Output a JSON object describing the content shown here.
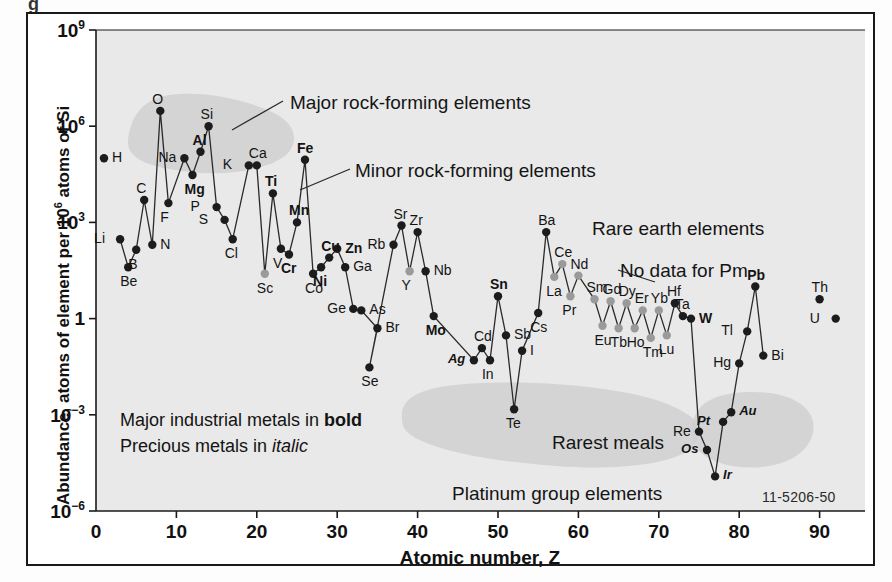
{
  "figure": {
    "id_code": "11-5206-50",
    "top_partial_glyph": "g"
  },
  "axes": {
    "y_label_prefix": "Abundance, atoms of element per 10",
    "y_label_sup": "6",
    "y_label_suffix": " atoms of Si",
    "x_label": "Atomic number, Z",
    "y_ticks": [
      {
        "label": "10",
        "sup": "9",
        "value": 1000000000.0
      },
      {
        "label": "10",
        "sup": "6",
        "value": 1000000.0
      },
      {
        "label": "10",
        "sup": "3",
        "value": 1000.0
      },
      {
        "label": "1",
        "sup": "",
        "value": 1
      },
      {
        "label": "10",
        "sup": "−3",
        "value": 0.001
      },
      {
        "label": "10",
        "sup": "−6",
        "value": 1e-06
      }
    ],
    "x_ticks": [
      "0",
      "10",
      "20",
      "30",
      "40",
      "50",
      "60",
      "70",
      "80",
      "90"
    ]
  },
  "annotations": [
    {
      "name": "major-rock-forming",
      "text": "Major rock-forming elements"
    },
    {
      "name": "minor-rock-forming",
      "text": "Minor rock-forming elements"
    },
    {
      "name": "rare-earth",
      "text": "Rare earth elements"
    },
    {
      "name": "no-data-pm",
      "text": "No data for Pm"
    },
    {
      "name": "rarest-metals",
      "text": "Rarest meals"
    },
    {
      "name": "platinum-group",
      "text": "Platinum group elements"
    }
  ],
  "legend": {
    "line1_pre": "Major industrial metals in ",
    "line1_bold": "bold",
    "line2_pre": "Precious metals in ",
    "line2_ital": "italic"
  },
  "colors": {
    "plot_background": "#e9e9e9",
    "highlight_blob": "#cfcfcf",
    "point_dark": "#1c1c1c",
    "point_light": "#9a9a9a",
    "line": "#2a2a2a",
    "frame": "#1a1a1a",
    "text": "#141414"
  },
  "chart_data": {
    "type": "scatter",
    "title": "",
    "xlabel": "Atomic number, Z",
    "ylabel": "Abundance, atoms of element per 10^6 atoms of Si",
    "xlim": [
      0,
      95
    ],
    "ylim": [
      1e-06,
      1000000000.0
    ],
    "yscale": "log",
    "grid": false,
    "legend": "none",
    "note": "Abundance of the chemical elements in Earth's crust versus atomic number Z. Values are atoms of element per 10^6 atoms of Si.",
    "points": [
      {
        "symbol": "H",
        "z": 1,
        "value": 100000.0,
        "style": "plain",
        "lpos": "right",
        "connected": false,
        "shade": "dark"
      },
      {
        "symbol": "Li",
        "z": 3,
        "value": 300.0,
        "style": "plain",
        "lpos": "left",
        "connected": true,
        "shade": "dark"
      },
      {
        "symbol": "Be",
        "z": 4,
        "value": 40.0,
        "style": "plain",
        "lpos": "below",
        "connected": true,
        "shade": "dark"
      },
      {
        "symbol": "B",
        "z": 5,
        "value": 140.0,
        "style": "plain",
        "lpos": "below",
        "connected": true,
        "shade": "dark"
      },
      {
        "symbol": "C",
        "z": 6,
        "value": 5000.0,
        "style": "plain",
        "lpos": "above",
        "connected": true,
        "shade": "dark"
      },
      {
        "symbol": "N",
        "z": 7,
        "value": 200.0,
        "style": "right",
        "lpos": "right",
        "connected": true,
        "shade": "dark"
      },
      {
        "symbol": "O",
        "z": 8,
        "value": 3000000.0,
        "style": "plain",
        "lpos": "above",
        "connected": true,
        "shade": "dark"
      },
      {
        "symbol": "F",
        "z": 9,
        "value": 4000.0,
        "style": "plain",
        "lpos": "below",
        "connected": true,
        "shade": "dark"
      },
      {
        "symbol": "Na",
        "z": 11,
        "value": 100000.0,
        "style": "plain",
        "lpos": "left",
        "connected": true,
        "shade": "dark"
      },
      {
        "symbol": "Mg",
        "z": 12,
        "value": 30000.0,
        "style": "bold",
        "lpos": "below",
        "connected": true,
        "shade": "dark"
      },
      {
        "symbol": "Al",
        "z": 13,
        "value": 160000.0,
        "style": "bold",
        "lpos": "above",
        "connected": true,
        "shade": "dark"
      },
      {
        "symbol": "Si",
        "z": 14,
        "value": 1000000.0,
        "style": "plain",
        "lpos": "above",
        "connected": true,
        "shade": "dark"
      },
      {
        "symbol": "P",
        "z": 15,
        "value": 3000.0,
        "style": "plain",
        "lpos": "left",
        "connected": true,
        "shade": "dark"
      },
      {
        "symbol": "S",
        "z": 16,
        "value": 1200.0,
        "style": "plain",
        "lpos": "left",
        "connected": true,
        "shade": "dark"
      },
      {
        "symbol": "Cl",
        "z": 17,
        "value": 300.0,
        "style": "plain",
        "lpos": "below",
        "connected": true,
        "shade": "dark"
      },
      {
        "symbol": "K",
        "z": 19,
        "value": 60000.0,
        "style": "plain",
        "lpos": "left",
        "connected": true,
        "shade": "dark"
      },
      {
        "symbol": "Ca",
        "z": 20,
        "value": 60000.0,
        "style": "plain",
        "lpos": "above",
        "connected": true,
        "shade": "dark"
      },
      {
        "symbol": "Sc",
        "z": 21,
        "value": 25.0,
        "style": "plain",
        "lpos": "below",
        "connected": true,
        "shade": "light"
      },
      {
        "symbol": "Ti",
        "z": 22,
        "value": 8000.0,
        "style": "bold",
        "lpos": "above",
        "connected": true,
        "shade": "dark"
      },
      {
        "symbol": "V",
        "z": 23,
        "value": 150.0,
        "style": "plain",
        "lpos": "below",
        "connected": true,
        "shade": "dark"
      },
      {
        "symbol": "Cr",
        "z": 24,
        "value": 100.0,
        "style": "bold",
        "lpos": "below",
        "connected": true,
        "shade": "dark"
      },
      {
        "symbol": "Mn",
        "z": 25,
        "value": 1000.0,
        "style": "bold",
        "lpos": "above",
        "connected": true,
        "shade": "dark"
      },
      {
        "symbol": "Fe",
        "z": 26,
        "value": 90000.0,
        "style": "bold",
        "lpos": "above",
        "connected": true,
        "shade": "dark"
      },
      {
        "symbol": "Co",
        "z": 27,
        "value": 25.0,
        "style": "plain",
        "lpos": "below",
        "connected": true,
        "shade": "dark"
      },
      {
        "symbol": "Ni",
        "z": 28,
        "value": 40.0,
        "style": "bold",
        "lpos": "below",
        "connected": true,
        "shade": "dark"
      },
      {
        "symbol": "Cu",
        "z": 29,
        "value": 80.0,
        "style": "bold",
        "lpos": "above",
        "connected": true,
        "shade": "dark"
      },
      {
        "symbol": "Zn",
        "z": 30,
        "value": 150.0,
        "style": "bold",
        "lpos": "right",
        "connected": true,
        "shade": "dark"
      },
      {
        "symbol": "Ga",
        "z": 31,
        "value": 40.0,
        "style": "right",
        "lpos": "right",
        "connected": true,
        "shade": "dark"
      },
      {
        "symbol": "Ge",
        "z": 32,
        "value": 2.0,
        "style": "plain",
        "lpos": "left",
        "connected": true,
        "shade": "dark"
      },
      {
        "symbol": "As",
        "z": 33,
        "value": 1.8,
        "style": "plain",
        "lpos": "right",
        "connected": true,
        "shade": "dark"
      },
      {
        "symbol": "Br",
        "z": 35,
        "value": 0.5,
        "style": "plain",
        "lpos": "right",
        "connected": true,
        "shade": "dark"
      },
      {
        "symbol": "Se",
        "z": 34,
        "value": 0.03,
        "style": "plain",
        "lpos": "below",
        "connected": true,
        "shade": "dark"
      },
      {
        "symbol": "Rb",
        "z": 37,
        "value": 200.0,
        "style": "plain",
        "lpos": "left",
        "connected": true,
        "shade": "dark"
      },
      {
        "symbol": "Sr",
        "z": 38,
        "value": 800.0,
        "style": "plain",
        "lpos": "above",
        "connected": true,
        "shade": "dark"
      },
      {
        "symbol": "Y",
        "z": 39,
        "value": 30.0,
        "style": "plain",
        "lpos": "below",
        "connected": true,
        "shade": "light"
      },
      {
        "symbol": "Zr",
        "z": 40,
        "value": 500.0,
        "style": "plain",
        "lpos": "above",
        "connected": true,
        "shade": "dark"
      },
      {
        "symbol": "Nb",
        "z": 41,
        "value": 30.0,
        "style": "plain",
        "lpos": "right",
        "connected": true,
        "shade": "dark"
      },
      {
        "symbol": "Mo",
        "z": 42,
        "value": 1.2,
        "style": "bold",
        "lpos": "below",
        "connected": true,
        "shade": "dark"
      },
      {
        "symbol": "Ag",
        "z": 47,
        "value": 0.05,
        "style": "ital",
        "lpos": "left",
        "connected": true,
        "shade": "dark"
      },
      {
        "symbol": "Cd",
        "z": 48,
        "value": 0.12,
        "style": "plain",
        "lpos": "above",
        "connected": true,
        "shade": "dark"
      },
      {
        "symbol": "In",
        "z": 49,
        "value": 0.05,
        "style": "plain",
        "lpos": "below",
        "connected": true,
        "shade": "dark"
      },
      {
        "symbol": "Sn",
        "z": 50,
        "value": 5.0,
        "style": "bold",
        "lpos": "above",
        "connected": true,
        "shade": "dark"
      },
      {
        "symbol": "Sb",
        "z": 51,
        "value": 0.3,
        "style": "right",
        "lpos": "right",
        "connected": true,
        "shade": "dark"
      },
      {
        "symbol": "Te",
        "z": 52,
        "value": 0.0015,
        "style": "plain",
        "lpos": "below",
        "connected": true,
        "shade": "dark"
      },
      {
        "symbol": "I",
        "z": 53,
        "value": 0.1,
        "style": "right",
        "lpos": "right",
        "connected": true,
        "shade": "dark"
      },
      {
        "symbol": "Cs",
        "z": 55,
        "value": 1.5,
        "style": "plain",
        "lpos": "below",
        "connected": true,
        "shade": "dark"
      },
      {
        "symbol": "Ba",
        "z": 56,
        "value": 500.0,
        "style": "plain",
        "lpos": "above",
        "connected": true,
        "shade": "dark"
      },
      {
        "symbol": "La",
        "z": 57,
        "value": 20.0,
        "style": "plain",
        "lpos": "below",
        "connected": true,
        "shade": "light"
      },
      {
        "symbol": "Ce",
        "z": 58,
        "value": 50.0,
        "style": "plain",
        "lpos": "above",
        "connected": true,
        "shade": "light"
      },
      {
        "symbol": "Pr",
        "z": 59,
        "value": 5.0,
        "style": "plain",
        "lpos": "below",
        "connected": true,
        "shade": "light"
      },
      {
        "symbol": "Nd",
        "z": 60,
        "value": 22.0,
        "style": "plain",
        "lpos": "above",
        "connected": true,
        "shade": "light"
      },
      {
        "symbol": "Sm",
        "z": 62,
        "value": 4.0,
        "style": "plain",
        "lpos": "above",
        "connected": true,
        "shade": "light"
      },
      {
        "symbol": "Eu",
        "z": 63,
        "value": 0.6,
        "style": "plain",
        "lpos": "below",
        "connected": true,
        "shade": "light"
      },
      {
        "symbol": "Gd",
        "z": 64,
        "value": 3.5,
        "style": "plain",
        "lpos": "above",
        "connected": true,
        "shade": "light"
      },
      {
        "symbol": "Tb",
        "z": 65,
        "value": 0.5,
        "style": "plain",
        "lpos": "below",
        "connected": true,
        "shade": "light"
      },
      {
        "symbol": "Dy",
        "z": 66,
        "value": 3.0,
        "style": "plain",
        "lpos": "above",
        "connected": true,
        "shade": "light"
      },
      {
        "symbol": "Ho",
        "z": 67,
        "value": 0.5,
        "style": "plain",
        "lpos": "below",
        "connected": true,
        "shade": "light"
      },
      {
        "symbol": "Er",
        "z": 68,
        "value": 1.8,
        "style": "plain",
        "lpos": "above",
        "connected": true,
        "shade": "light"
      },
      {
        "symbol": "Tm",
        "z": 69,
        "value": 0.25,
        "style": "plain",
        "lpos": "below",
        "connected": true,
        "shade": "light"
      },
      {
        "symbol": "Yb",
        "z": 70,
        "value": 1.8,
        "style": "plain",
        "lpos": "above",
        "connected": true,
        "shade": "light"
      },
      {
        "symbol": "Lu",
        "z": 71,
        "value": 0.3,
        "style": "plain",
        "lpos": "below",
        "connected": true,
        "shade": "light"
      },
      {
        "symbol": "Hf",
        "z": 72,
        "value": 3.0,
        "style": "plain",
        "lpos": "above",
        "connected": true,
        "shade": "dark"
      },
      {
        "symbol": "Ta",
        "z": 73,
        "value": 1.2,
        "style": "plain",
        "lpos": "above",
        "connected": true,
        "shade": "dark"
      },
      {
        "symbol": "W",
        "z": 74,
        "value": 1.0,
        "style": "bold",
        "lpos": "right",
        "connected": true,
        "shade": "dark"
      },
      {
        "symbol": "Re",
        "z": 75,
        "value": 0.0003,
        "style": "plain",
        "lpos": "left",
        "connected": true,
        "shade": "dark"
      },
      {
        "symbol": "Os",
        "z": 76,
        "value": 8e-05,
        "style": "ital",
        "lpos": "left",
        "connected": true,
        "shade": "dark"
      },
      {
        "symbol": "Ir",
        "z": 77,
        "value": 1.2e-05,
        "style": "ital",
        "lpos": "right",
        "connected": true,
        "shade": "dark"
      },
      {
        "symbol": "Pt",
        "z": 78,
        "value": 0.0006,
        "style": "ital",
        "lpos": "left",
        "connected": true,
        "shade": "dark"
      },
      {
        "symbol": "Au",
        "z": 79,
        "value": 0.0012,
        "style": "ital",
        "lpos": "right",
        "connected": true,
        "shade": "dark"
      },
      {
        "symbol": "Hg",
        "z": 80,
        "value": 0.04,
        "style": "plain",
        "lpos": "left",
        "connected": true,
        "shade": "dark"
      },
      {
        "symbol": "Tl",
        "z": 81,
        "value": 0.4,
        "style": "plain",
        "lpos": "left",
        "connected": true,
        "shade": "dark"
      },
      {
        "symbol": "Pb",
        "z": 82,
        "value": 10.0,
        "style": "bold",
        "lpos": "above",
        "connected": true,
        "shade": "dark"
      },
      {
        "symbol": "Bi",
        "z": 83,
        "value": 0.07,
        "style": "plain",
        "lpos": "right",
        "connected": true,
        "shade": "dark"
      },
      {
        "symbol": "Th",
        "z": 90,
        "value": 4.0,
        "style": "plain",
        "lpos": "above",
        "connected": false,
        "shade": "dark"
      },
      {
        "symbol": "U",
        "z": 92,
        "value": 1.0,
        "style": "plain",
        "lpos": "left",
        "connected": false,
        "shade": "dark"
      }
    ]
  }
}
